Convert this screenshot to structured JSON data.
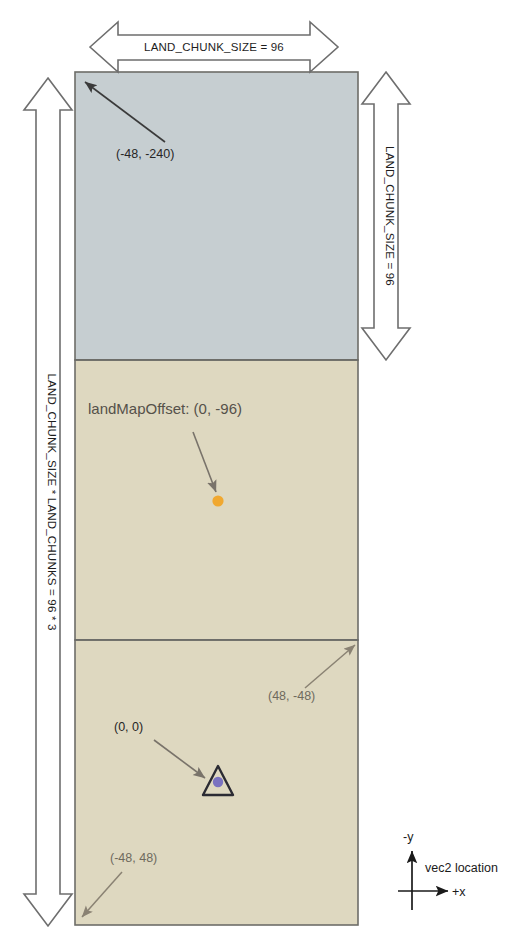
{
  "diagram": {
    "dimensions": {
      "top_width_label": "LAND_CHUNK_SIZE = 96",
      "right_height_label": "LAND_CHUNK_SIZE = 96",
      "left_height_label": "LAND_CHUNK_SIZE * LAND_CHUNKS = 96 * 3"
    },
    "offset_label": "landMapOffset: (0, -96)",
    "coordinates": {
      "top_left": "(-48, -240)",
      "mid_right": "(48, -48)",
      "origin": "(0, 0)",
      "bottom_left": "(-48, 48)"
    },
    "axis_legend": {
      "y_label": "-y",
      "x_label": "+x",
      "caption": "vec2 location"
    },
    "chunks": [
      {
        "name": "chunk-top",
        "fill": "#c6ced1"
      },
      {
        "name": "chunk-middle",
        "fill": "#ded8c0"
      },
      {
        "name": "chunk-bottom",
        "fill": "#ded8c0"
      }
    ],
    "markers": {
      "land_map_offset_dot_color": "#f0a830",
      "origin_dot_color": "#7a72c0"
    }
  }
}
